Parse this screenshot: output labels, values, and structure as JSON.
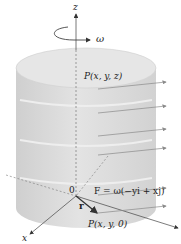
{
  "diagram": {
    "labels": {
      "z_axis": "z",
      "x_axis": "x",
      "omega": "ω",
      "point_top": "P(x, y, z)",
      "origin": "0",
      "r_vector": "r",
      "point_bottom": "P(x, y, 0)",
      "field_equation": "F = ω(−yi + xj)"
    },
    "arrow_count": 6,
    "colors": {
      "cylinder_fill": "#d9d9d9",
      "cylinder_top": "#e4e4e4",
      "arrow": "#8a8a8a",
      "axis": "#555555",
      "text": "#222222"
    }
  }
}
